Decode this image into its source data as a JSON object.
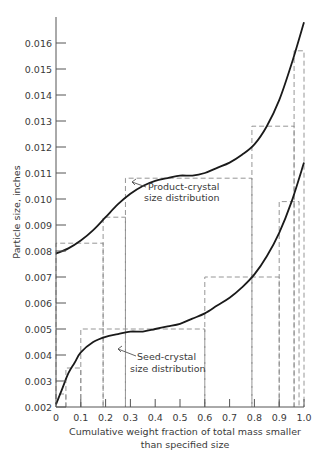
{
  "chart_data": {
    "type": "line",
    "title": "",
    "xlabel": "Cumulative weight fraction of total mass smaller",
    "xlabel_line2": "than specified size",
    "ylabel": "Particle  size, inches",
    "xlim": [
      0,
      1.0
    ],
    "ylim": [
      0.002,
      0.0168
    ],
    "grid": false,
    "x_ticks": [
      0,
      0.1,
      0.2,
      0.3,
      0.4,
      0.5,
      0.6,
      0.7,
      0.8,
      0.9,
      1.0
    ],
    "x_tick_labels": [
      "0",
      "0.1",
      "0.2",
      "0.3",
      "0.4",
      "0.5",
      "0.6",
      "0.7",
      "0.8",
      "0.9",
      "1.0"
    ],
    "y_ticks": [
      0.002,
      0.003,
      0.004,
      0.005,
      0.006,
      0.007,
      0.008,
      0.009,
      0.01,
      0.011,
      0.012,
      0.013,
      0.014,
      0.015,
      0.016
    ],
    "y_tick_labels": [
      "0.002",
      "0.003",
      "0.004",
      "0.005",
      "0.006",
      "0.007",
      "0.008",
      "0.009",
      "0.010",
      "0.011",
      "0.012",
      "0.013",
      "0.014",
      "0.015",
      "0.016"
    ],
    "series": [
      {
        "name": "Product-crystal size distribution",
        "style": "solid",
        "x": [
          0,
          0.05,
          0.1,
          0.15,
          0.2,
          0.25,
          0.3,
          0.35,
          0.4,
          0.45,
          0.5,
          0.55,
          0.6,
          0.65,
          0.7,
          0.75,
          0.8,
          0.85,
          0.9,
          0.95,
          1.0
        ],
        "y": [
          0.0079,
          0.0081,
          0.0084,
          0.0088,
          0.0093,
          0.0098,
          0.0102,
          0.0105,
          0.0107,
          0.0108,
          0.0109,
          0.0109,
          0.011,
          0.0112,
          0.0114,
          0.0117,
          0.0121,
          0.0128,
          0.0138,
          0.0152,
          0.0168
        ]
      },
      {
        "name": "Seed-crystal size distribution",
        "style": "solid",
        "x": [
          0,
          0.025,
          0.05,
          0.075,
          0.1,
          0.15,
          0.2,
          0.25,
          0.3,
          0.35,
          0.4,
          0.45,
          0.5,
          0.55,
          0.6,
          0.65,
          0.7,
          0.75,
          0.8,
          0.85,
          0.9,
          0.95,
          1.0
        ],
        "y": [
          0.0021,
          0.0027,
          0.0033,
          0.0037,
          0.0041,
          0.0045,
          0.0047,
          0.0048,
          0.0049,
          0.0049,
          0.005,
          0.0051,
          0.0052,
          0.0054,
          0.0056,
          0.0059,
          0.0062,
          0.0066,
          0.0071,
          0.0078,
          0.0087,
          0.0099,
          0.0114
        ]
      }
    ],
    "histograms": [
      {
        "name": "Product-crystal histogram",
        "style": "dashed",
        "bins": [
          {
            "x0": 0.0,
            "x1": 0.19,
            "y": 0.0083
          },
          {
            "x0": 0.19,
            "x1": 0.28,
            "y": 0.0093
          },
          {
            "x0": 0.28,
            "x1": 0.79,
            "y": 0.0108
          },
          {
            "x0": 0.79,
            "x1": 0.96,
            "y": 0.0128
          },
          {
            "x0": 0.96,
            "x1": 1.0,
            "y": 0.0157
          }
        ]
      },
      {
        "name": "Seed-crystal histogram",
        "style": "dashed",
        "bins": [
          {
            "x0": 0.0,
            "x1": 0.04,
            "y": 0.0025
          },
          {
            "x0": 0.04,
            "x1": 0.1,
            "y": 0.0035
          },
          {
            "x0": 0.1,
            "x1": 0.6,
            "y": 0.005
          },
          {
            "x0": 0.6,
            "x1": 0.9,
            "y": 0.007
          },
          {
            "x0": 0.9,
            "x1": 0.98,
            "y": 0.0099
          }
        ]
      }
    ],
    "annotations": [
      {
        "lines": [
          "Product-crystal",
          "size distribution"
        ],
        "points_to": {
          "x": 0.28,
          "y": 0.0098
        }
      },
      {
        "lines": [
          "Seed-crystal",
          "size distribution"
        ],
        "points_to": {
          "x": 0.21,
          "y": 0.0047
        }
      }
    ]
  }
}
